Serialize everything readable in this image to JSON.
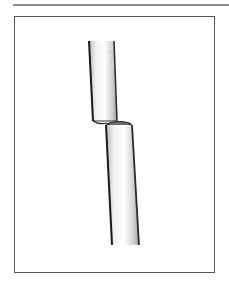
{
  "figure": {
    "colors": {
      "rule": "#8c8c8c",
      "frame": "#555555",
      "outline": "#1a1a1a",
      "shade": "#9a9a9a",
      "fill": "#f4f4f4"
    }
  }
}
